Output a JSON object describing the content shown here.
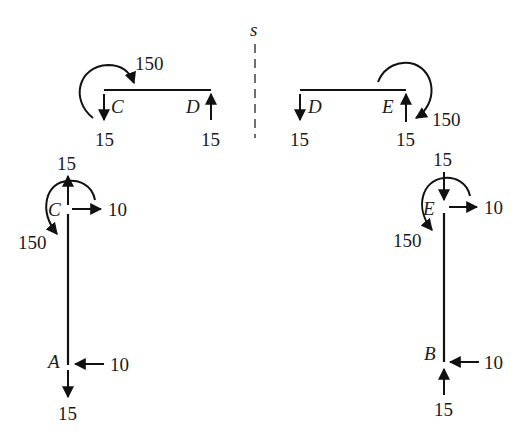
{
  "diagram": {
    "type": "free-body diagram",
    "symmetry_axis_label": "s",
    "colors": {
      "ink": "#111111",
      "background": "#ffffff"
    },
    "beam_left": {
      "ends": [
        "C",
        "D"
      ],
      "moment_at_C": "150",
      "force_at_C": "15",
      "force_at_D": "15"
    },
    "beam_right": {
      "ends": [
        "D",
        "E"
      ],
      "moment_at_E": "150",
      "force_at_D": "15",
      "force_at_E": "15"
    },
    "column_left": {
      "top": "C",
      "bottom": "A",
      "vertical_at_C": "15",
      "horizontal_at_C": "10",
      "moment_at_C": "150",
      "horizontal_at_A": "10",
      "vertical_at_A": "15"
    },
    "column_right": {
      "top": "E",
      "bottom": "B",
      "vertical_at_E": "15",
      "horizontal_at_E": "10",
      "moment_at_E": "150",
      "horizontal_at_B": "10",
      "vertical_at_B": "15"
    }
  }
}
